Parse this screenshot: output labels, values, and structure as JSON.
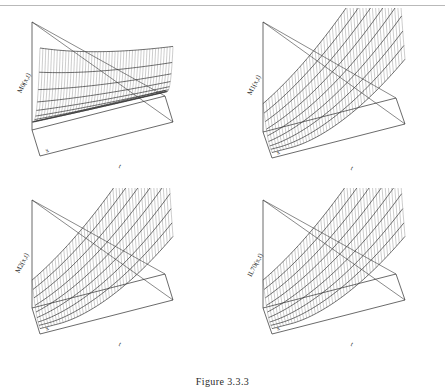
{
  "figure": {
    "caption": "Figure 3.3.3",
    "layout": "2x2 grid of 3D surface mesh plots",
    "axis_x_label": "x",
    "axis_t_label": "t",
    "line_color": "#3a3a3a",
    "mesh_color": "#6e6e6e",
    "background": "#ffffff"
  },
  "panels": [
    {
      "id": "panel-top-left",
      "zlabel": "M0(x,t)",
      "xlabel": "x",
      "tlabel": "t",
      "surface": "monotone decreasing ridge, high at back-left, falling toward front",
      "ribs": 9,
      "mesh_lines": 46
    },
    {
      "id": "panel-top-right",
      "zlabel": "M1(x,t)",
      "xlabel": "x",
      "tlabel": "t",
      "surface": "concave valley rising steeply toward back-right",
      "ribs": 8,
      "mesh_lines": 46
    },
    {
      "id": "panel-bottom-left",
      "zlabel": "M2(x,t)",
      "xlabel": "x",
      "tlabel": "t",
      "surface": "concave valley rising steeply toward back-right",
      "ribs": 8,
      "mesh_lines": 46
    },
    {
      "id": "panel-bottom-right",
      "zlabel": "IL70(x,t)",
      "xlabel": "x",
      "tlabel": "t",
      "surface": "concave valley rising steeply toward back-right",
      "ribs": 8,
      "mesh_lines": 46
    }
  ],
  "chart_data": {
    "type": "line",
    "title": "Figure 3.3.3",
    "xlabel": "x",
    "ylabel": "t",
    "grid": false,
    "legend": "none",
    "subplots": [
      {
        "name": "M0(x,t)",
        "zlabel": "M0(x,t)",
        "xlabel": "x",
        "tlabel": "t",
        "shape": "decreasing-ridge"
      },
      {
        "name": "M1(x,t)",
        "zlabel": "M1(x,t)",
        "xlabel": "x",
        "tlabel": "t",
        "shape": "concave-valley"
      },
      {
        "name": "M2(x,t)",
        "zlabel": "M2(x,t)",
        "xlabel": "x",
        "tlabel": "t",
        "shape": "concave-valley"
      },
      {
        "name": "IL70(x,t)",
        "zlabel": "IL70(x,t)",
        "xlabel": "x",
        "tlabel": "t",
        "shape": "concave-valley"
      }
    ]
  }
}
